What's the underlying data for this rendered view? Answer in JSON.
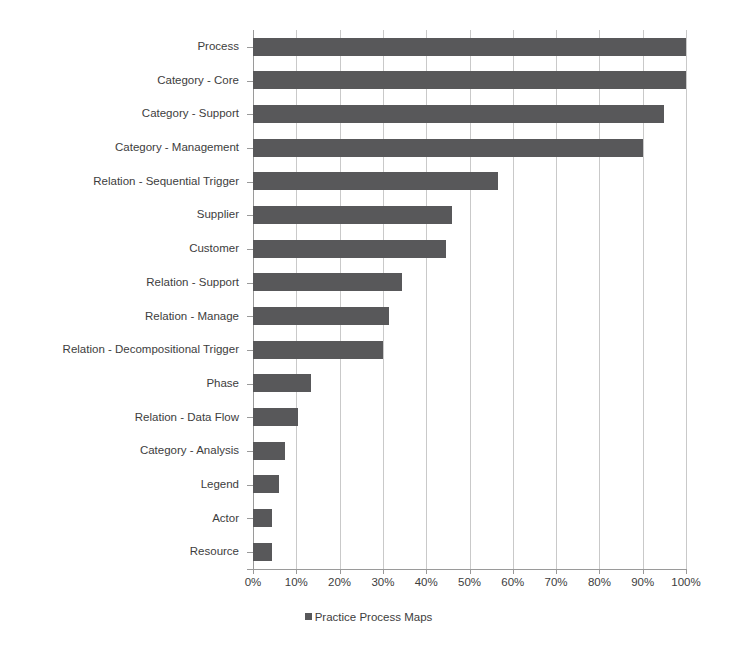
{
  "chart_data": {
    "type": "bar",
    "orientation": "horizontal",
    "title": "",
    "xlabel": "",
    "ylabel": "",
    "xlim": [
      0,
      100
    ],
    "xtick_step": 10,
    "grid": true,
    "legend_position": "bottom",
    "value_suffix": "%",
    "series": [
      {
        "name": "Practice Process Maps",
        "color": "#58585a",
        "values": [
          100,
          100,
          95,
          90,
          56.5,
          46,
          44.5,
          34.5,
          31.5,
          30,
          13.5,
          10.5,
          7.5,
          6,
          4.5,
          4.5
        ]
      }
    ],
    "categories": [
      "Process",
      "Category - Core",
      "Category - Support",
      "Category - Management",
      "Relation - Sequential Trigger",
      "Supplier",
      "Customer",
      "Relation - Support",
      "Relation - Manage",
      "Relation - Decompositional Trigger",
      "Phase",
      "Relation - Data Flow",
      "Category - Analysis",
      "Legend",
      "Actor",
      "Resource"
    ],
    "xticks": [
      {
        "value": 0,
        "label": "0%"
      },
      {
        "value": 10,
        "label": "10%"
      },
      {
        "value": 20,
        "label": "20%"
      },
      {
        "value": 30,
        "label": "30%"
      },
      {
        "value": 40,
        "label": "40%"
      },
      {
        "value": 50,
        "label": "50%"
      },
      {
        "value": 60,
        "label": "60%"
      },
      {
        "value": 70,
        "label": "70%"
      },
      {
        "value": 80,
        "label": "80%"
      },
      {
        "value": 90,
        "label": "90%"
      },
      {
        "value": 100,
        "label": "100%"
      }
    ],
    "legend": [
      {
        "label": "Practice Process Maps",
        "color": "#58585a",
        "marker": "square"
      }
    ],
    "colors": {
      "bar": "#58585a",
      "gridline": "#c9c9c9",
      "axis": "#9a9a9a",
      "text": "#3d3d3d",
      "background": "#ffffff"
    }
  }
}
